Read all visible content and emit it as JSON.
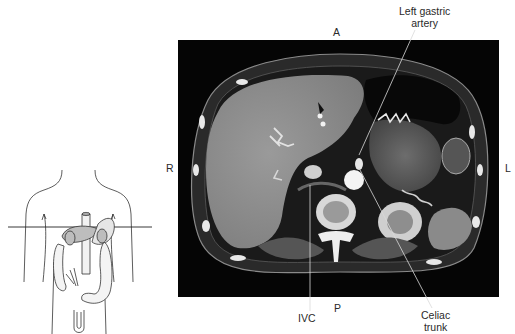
{
  "figure": {
    "type": "axial CT anatomy figure",
    "orientation_labels": {
      "anterior": "A",
      "posterior": "P",
      "right": "R",
      "left": "L"
    },
    "annotations": [
      {
        "id": "left-gastric-artery",
        "line1": "Left gastric",
        "line2": "artery"
      },
      {
        "id": "ivc",
        "line1": "IVC"
      },
      {
        "id": "celiac-trunk",
        "line1": "Celiac",
        "line2": "trunk"
      }
    ],
    "locator": {
      "description": "Torso outline with abdominal organs and horizontal scan plane line"
    },
    "colors": {
      "background": "#ffffff",
      "ct_background": "#050505",
      "label_text": "#2a2a2a",
      "leader_line": "#d9d9d9"
    }
  }
}
